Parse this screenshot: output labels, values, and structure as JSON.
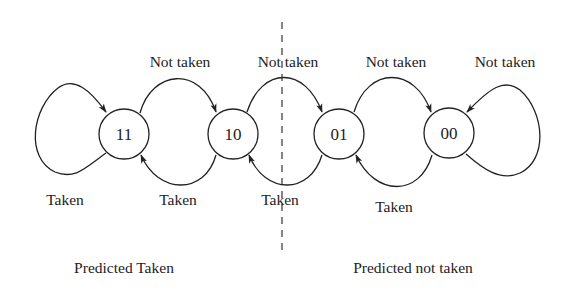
{
  "diagram": {
    "states": [
      {
        "id": "11",
        "label": "11"
      },
      {
        "id": "10",
        "label": "10"
      },
      {
        "id": "01",
        "label": "01"
      },
      {
        "id": "00",
        "label": "00"
      }
    ],
    "transitions": [
      {
        "from": "11",
        "to": "11",
        "label": "Taken"
      },
      {
        "from": "11",
        "to": "10",
        "label": "Not taken"
      },
      {
        "from": "10",
        "to": "11",
        "label": "Taken"
      },
      {
        "from": "10",
        "to": "01",
        "label": "Not taken"
      },
      {
        "from": "01",
        "to": "10",
        "label": "Taken"
      },
      {
        "from": "01",
        "to": "00",
        "label": "Not taken"
      },
      {
        "from": "00",
        "to": "01",
        "label": "Taken"
      },
      {
        "from": "00",
        "to": "00",
        "label": "Not taken"
      }
    ],
    "regions": [
      {
        "label": "Predicted Taken"
      },
      {
        "label": "Predicted not taken"
      }
    ],
    "colors": {
      "stroke": "#222222",
      "background": "#ffffff"
    }
  }
}
